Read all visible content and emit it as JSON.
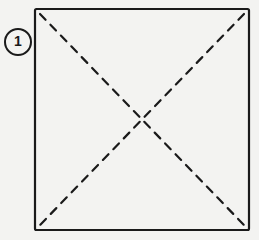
{
  "diagram": {
    "step": {
      "number": "1"
    },
    "square": {
      "x": 35,
      "y": 9,
      "width": 214,
      "height": 221,
      "stroke": "#1a1a1a"
    },
    "fold_lines": [
      {
        "type": "valley",
        "style": "dashed",
        "from": "top-left",
        "to": "bottom-right"
      },
      {
        "type": "valley",
        "style": "dashed",
        "from": "top-right",
        "to": "bottom-left"
      }
    ],
    "colors": {
      "background": "#f3f3f1",
      "line": "#1a1a1a"
    }
  }
}
